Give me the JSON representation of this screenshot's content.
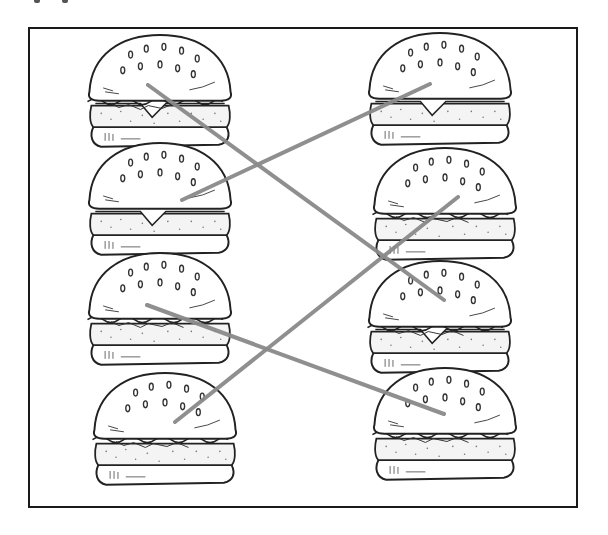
{
  "worksheet": {
    "task": "match-the-pairs",
    "frame": {
      "x": 28,
      "y": 27,
      "width": 550,
      "height": 481,
      "border_color": "#1a1a1a"
    },
    "line_color": "#8a8a8a",
    "line_width": 4,
    "left_column": [
      {
        "id": "L1",
        "type": "cheeseburger-with-lettuce",
        "cx": 160,
        "cy": 92,
        "fillings": [
          "lettuce",
          "cheese",
          "patty"
        ]
      },
      {
        "id": "L2",
        "type": "plain-cheeseburger",
        "cx": 160,
        "cy": 200,
        "fillings": [
          "cheese",
          "patty"
        ]
      },
      {
        "id": "L3",
        "type": "chicken-lettuce-burger",
        "cx": 160,
        "cy": 310,
        "fillings": [
          "lettuce",
          "sauce",
          "patty"
        ]
      },
      {
        "id": "L4",
        "type": "deluxe-burger",
        "cx": 165,
        "cy": 430,
        "fillings": [
          "lettuce",
          "tomato",
          "patty"
        ]
      }
    ],
    "right_column": [
      {
        "id": "R1",
        "type": "plain-cheeseburger",
        "cx": 440,
        "cy": 90,
        "fillings": [
          "cheese",
          "patty"
        ]
      },
      {
        "id": "R2",
        "type": "deluxe-burger",
        "cx": 445,
        "cy": 205,
        "fillings": [
          "lettuce",
          "tomato",
          "patty"
        ]
      },
      {
        "id": "R3",
        "type": "cheeseburger-with-lettuce",
        "cx": 440,
        "cy": 318,
        "fillings": [
          "lettuce",
          "cheese",
          "patty"
        ]
      },
      {
        "id": "R4",
        "type": "chicken-lettuce-burger",
        "cx": 445,
        "cy": 425,
        "fillings": [
          "lettuce",
          "sauce",
          "patty"
        ]
      }
    ],
    "connections": [
      {
        "from": "L1",
        "to": "R3",
        "x1": 148,
        "y1": 85,
        "x2": 444,
        "y2": 300
      },
      {
        "from": "L2",
        "to": "R1",
        "x1": 182,
        "y1": 200,
        "x2": 430,
        "y2": 84
      },
      {
        "from": "L3",
        "to": "R4",
        "x1": 147,
        "y1": 305,
        "x2": 444,
        "y2": 414
      },
      {
        "from": "L4",
        "to": "R2",
        "x1": 175,
        "y1": 422,
        "x2": 458,
        "y2": 197
      }
    ]
  }
}
